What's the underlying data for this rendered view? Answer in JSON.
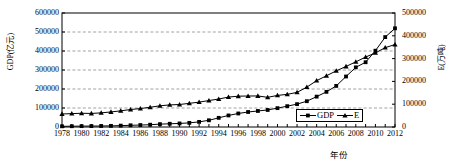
{
  "chart_data": {
    "type": "line",
    "title": "",
    "xlabel": "年份",
    "ylabel": "GDP(亿元)",
    "ylabel_right": "E(万吨)",
    "ylim": [
      0,
      600000
    ],
    "ylim_right": [
      0,
      500000
    ],
    "yticks": [
      "0",
      "100000",
      "200000",
      "300000",
      "400000",
      "500000",
      "600000"
    ],
    "yticks_right": [
      "0",
      "100000",
      "200000",
      "300000",
      "400000",
      "500000"
    ],
    "grid": true,
    "legend_position": "bottom-right",
    "x": [
      1978,
      1979,
      1980,
      1981,
      1982,
      1983,
      1984,
      1985,
      1986,
      1987,
      1988,
      1989,
      1990,
      1991,
      1992,
      1993,
      1994,
      1995,
      1996,
      1997,
      1998,
      1999,
      2000,
      2001,
      2002,
      2003,
      2004,
      2005,
      2006,
      2007,
      2008,
      2009,
      2010,
      2011,
      2012
    ],
    "xticks": [
      "1978",
      "1980",
      "1982",
      "1984",
      "1986",
      "1988",
      "1990",
      "1992",
      "1994",
      "1996",
      "1998",
      "2000",
      "2002",
      "2004",
      "2006",
      "2008",
      "2010",
      "2012"
    ],
    "series": [
      {
        "name": "GDP",
        "axis": "left",
        "marker": "square",
        "values": [
          3645,
          4063,
          4546,
          4892,
          5323,
          5963,
          7208,
          9016,
          10275,
          12059,
          15043,
          16992,
          18668,
          21781,
          26923,
          35334,
          48198,
          60794,
          71177,
          78973,
          84402,
          89677,
          99215,
          109655,
          120333,
          135823,
          159878,
          184937,
          216314,
          265810,
          314045,
          340903,
          401513,
          473104,
          519470
        ]
      },
      {
        "name": "E",
        "axis": "right",
        "marker": "triangle",
        "values": [
          57144,
          58588,
          60275,
          59447,
          62067,
          66040,
          70904,
          76682,
          80850,
          86632,
          92997,
          96934,
          98703,
          103783,
          109170,
          115993,
          122737,
          131176,
          135192,
          135909,
          136184,
          130119,
          138553,
          143199,
          151797,
          174990,
          203227,
          224682,
          246270,
          265583,
          285673,
          306647,
          324939,
          348002,
          361732
        ]
      }
    ]
  },
  "legend": {
    "items": [
      {
        "label": "GDP",
        "marker": "square"
      },
      {
        "label": "E",
        "marker": "triangle"
      }
    ]
  }
}
